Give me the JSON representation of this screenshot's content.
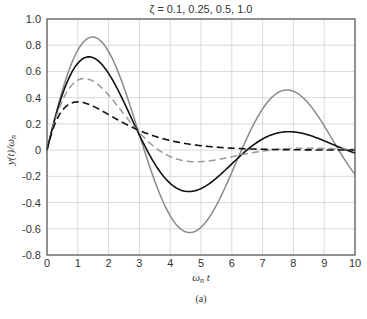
{
  "chart_data": {
    "type": "line",
    "title": "ζ = 0.1, 0.25, 0.5, 1.0",
    "xlabel": "ωn t",
    "ylabel": "y(t)/ωn",
    "caption": "(a)",
    "xlim": [
      0,
      10
    ],
    "ylim": [
      -0.8,
      1.0
    ],
    "xticks": [
      "0",
      "1",
      "2",
      "3",
      "4",
      "5",
      "6",
      "7",
      "8",
      "9",
      "10"
    ],
    "yticks": [
      "1.0",
      "0.8",
      "0.6",
      "0.4",
      "0.2",
      "0",
      "-0.2",
      "-0.4",
      "-0.6",
      "-0.8"
    ],
    "grid": true,
    "legend": "none",
    "series": [
      {
        "name": "ζ = 0.1",
        "style": "solid",
        "color": "#8a8a8a",
        "x": [
          0,
          0.5,
          1,
          1.5,
          2,
          2.5,
          3,
          3.5,
          4,
          4.5,
          5,
          5.5,
          6,
          6.5,
          7,
          7.5,
          8,
          8.5,
          9,
          9.5,
          10
        ],
        "values": [
          0,
          0.45,
          0.76,
          0.85,
          0.75,
          0.49,
          0.17,
          -0.17,
          -0.45,
          -0.6,
          -0.6,
          -0.46,
          -0.22,
          0.07,
          0.31,
          0.45,
          0.46,
          0.34,
          0.15,
          -0.05,
          -0.21
        ]
      },
      {
        "name": "ζ = 0.25",
        "style": "solid",
        "color": "#111111",
        "x": [
          0,
          0.5,
          1,
          1.5,
          2,
          2.5,
          3,
          3.5,
          4,
          4.5,
          5,
          5.5,
          6,
          6.5,
          7,
          7.5,
          8,
          8.5,
          9,
          9.5,
          10
        ],
        "values": [
          0,
          0.42,
          0.65,
          0.7,
          0.58,
          0.36,
          0.11,
          -0.12,
          -0.27,
          -0.31,
          -0.27,
          -0.17,
          -0.05,
          0.06,
          0.13,
          0.15,
          0.13,
          0.08,
          0.03,
          -0.02,
          -0.05
        ]
      },
      {
        "name": "ζ = 0.5",
        "style": "dashed",
        "color": "#9a9a9a",
        "x": [
          0,
          0.5,
          1,
          1.5,
          2,
          2.5,
          3,
          3.5,
          4,
          4.5,
          5,
          5.5,
          6,
          6.5,
          7,
          7.5,
          8,
          8.5,
          9,
          9.5,
          10
        ],
        "values": [
          0,
          0.38,
          0.52,
          0.52,
          0.43,
          0.3,
          0.18,
          0.07,
          -0.01,
          -0.06,
          -0.08,
          -0.08,
          -0.06,
          -0.04,
          -0.02,
          0.0,
          0.01,
          0.01,
          0.01,
          0.01,
          0.0
        ]
      },
      {
        "name": "ζ = 1.0",
        "style": "dashed",
        "color": "#111111",
        "x": [
          0,
          0.5,
          1,
          1.5,
          2,
          2.5,
          3,
          3.5,
          4,
          4.5,
          5,
          5.5,
          6,
          6.5,
          7,
          7.5,
          8,
          8.5,
          9,
          9.5,
          10
        ],
        "values": [
          0,
          0.3,
          0.37,
          0.33,
          0.27,
          0.21,
          0.15,
          0.11,
          0.07,
          0.05,
          0.03,
          0.02,
          0.01,
          0.01,
          0.01,
          0.0,
          0.0,
          0.0,
          0.0,
          0.0,
          0.0
        ]
      }
    ]
  },
  "colors": {
    "grid": "#cfcfcf",
    "axis": "#555555"
  }
}
